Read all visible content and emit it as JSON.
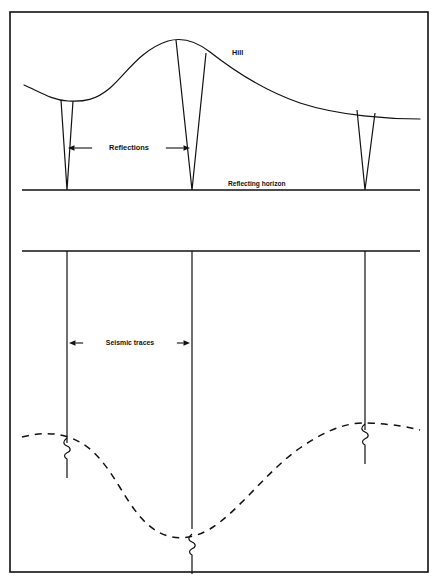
{
  "figure": {
    "background_color": "#ffffff",
    "line_color": "#111111",
    "border": {
      "x": 10,
      "y": 12,
      "width": 418,
      "height": 560,
      "stroke_width": 1.6
    }
  },
  "labels": {
    "hill": "Hill",
    "reflections": "Reflections",
    "reflecting_horizon": "Reflecting horizon",
    "seismic_traces": "Seismic traces"
  },
  "upper_panel": {
    "surface_name": "hill-surface-curve",
    "surface_path": "M 24,85 C 40,92 52,100 68,101 C 84,102 96,100 110,88 C 126,74 140,50 168,41 C 182,37 196,41 210,52 C 238,74 268,92 300,103 C 340,116 390,119 420,119",
    "horizon": {
      "name": "reflecting-horizon-line",
      "y": 190,
      "x_start": 22,
      "x_end": 420
    },
    "reflection_wedges": [
      {
        "name": "reflection-wedge-left",
        "left_top_x": 61,
        "left_top_y": 100,
        "right_top_x": 73,
        "right_top_y": 101,
        "apex_x": 67,
        "apex_y": 190
      },
      {
        "name": "reflection-wedge-center",
        "left_top_x": 176,
        "left_top_y": 40,
        "right_top_x": 206,
        "right_top_y": 53,
        "apex_x": 192,
        "apex_y": 190
      },
      {
        "name": "reflection-wedge-right",
        "left_top_x": 357,
        "left_top_y": 110,
        "right_top_x": 375,
        "right_top_y": 113,
        "apex_x": 365,
        "apex_y": 190
      }
    ],
    "reflections_arrow": {
      "name": "reflections-dimension-arrow",
      "y": 148,
      "x_start": 68,
      "x_end": 190,
      "label_x": 129,
      "label_y": 150
    },
    "hill_label_position": {
      "x": 232,
      "y": 55
    },
    "horizon_label_position": {
      "x": 228,
      "y": 186
    }
  },
  "lower_panel": {
    "datum_line": {
      "name": "lower-datum-line",
      "y": 251,
      "x_start": 22,
      "x_end": 420
    },
    "traces": [
      {
        "name": "seismic-trace-left",
        "x": 67,
        "y_start": 251,
        "y_end": 443
      },
      {
        "name": "seismic-trace-center",
        "x": 192,
        "y_start": 251,
        "y_end": 529
      },
      {
        "name": "seismic-trace-right",
        "x": 365,
        "y_start": 251,
        "y_end": 430
      }
    ],
    "reflection_curve": {
      "name": "dashed-reflection-curve",
      "path": "M 22,437 C 38,433 52,432 68,437 C 84,442 96,452 110,472 C 126,495 140,528 168,536 C 182,540 196,537 210,529 C 238,512 268,470 300,448 C 330,427 352,422 368,423 C 392,424 408,427 420,430",
      "dash_pattern": "7 6"
    },
    "wavelets": [
      {
        "name": "wavelet-squiggle-left",
        "x": 67,
        "y": 438,
        "tail_end_y": 478
      },
      {
        "name": "wavelet-squiggle-center",
        "x": 192,
        "y": 534,
        "tail_end_y": 574
      },
      {
        "name": "wavelet-squiggle-right",
        "x": 365,
        "y": 424,
        "tail_end_y": 464
      }
    ],
    "traces_arrow": {
      "name": "seismic-traces-dimension-arrow",
      "y": 343,
      "x_start": 69,
      "x_end": 190,
      "label_x": 130,
      "label_y": 345
    }
  }
}
